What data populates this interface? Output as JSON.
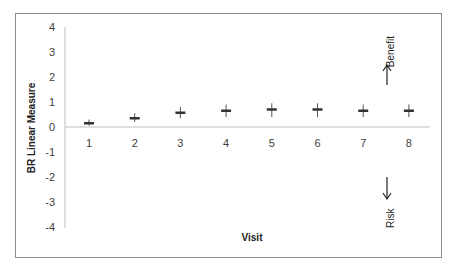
{
  "chart_data": {
    "type": "scatter",
    "title": "",
    "xlabel": "Visit",
    "ylabel": "BR Linear Measure",
    "categories": [
      "1",
      "2",
      "3",
      "4",
      "5",
      "6",
      "7",
      "8"
    ],
    "x": [
      1,
      2,
      3,
      4,
      5,
      6,
      7,
      8
    ],
    "series": [
      {
        "name": "BR Linear Measure",
        "marker": "plus with error bar",
        "values": [
          0.15,
          0.35,
          0.57,
          0.65,
          0.7,
          0.7,
          0.65,
          0.65
        ],
        "error_low": [
          0.05,
          0.2,
          0.35,
          0.4,
          0.4,
          0.4,
          0.4,
          0.4
        ],
        "error_high": [
          0.3,
          0.55,
          0.8,
          0.9,
          0.95,
          0.95,
          0.9,
          0.9
        ]
      }
    ],
    "ylim": [
      -4,
      4
    ],
    "yticks": [
      "4",
      "3",
      "2",
      "1",
      "0",
      "-1",
      "-2",
      "-3",
      "-4"
    ],
    "grid": false,
    "legend": null,
    "annotations": [
      {
        "text": "Benefit",
        "direction": "up-arrow"
      },
      {
        "text": "Risk",
        "direction": "down-arrow"
      }
    ]
  },
  "labels": {
    "ylabel": "BR Linear Measure",
    "xlabel": "Visit",
    "benefit": "Benefit",
    "risk": "Risk"
  }
}
